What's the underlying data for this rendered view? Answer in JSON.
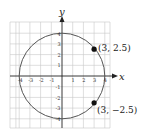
{
  "diagram": {
    "type": "circle-on-coordinate-grid",
    "x_axis_label": "x",
    "y_axis_label": "y",
    "x_ticks": [
      "-4",
      "-3",
      "-2",
      "-1",
      "1",
      "2",
      "3",
      "4"
    ],
    "y_ticks": [
      "4",
      "3",
      "2",
      "1",
      "-1",
      "-2",
      "-3",
      "-4"
    ],
    "circle": {
      "center": [
        0,
        0
      ],
      "radius": 4
    },
    "points": [
      {
        "label": "(3, 2.5)",
        "x": 3,
        "y": 2.5
      },
      {
        "label": "(3, −2.5)",
        "x": 3,
        "y": -2.5
      }
    ],
    "colors": {
      "circle": "#555555",
      "grid": "#c8c8c8",
      "axis": "#222222",
      "point": "#111111"
    }
  }
}
